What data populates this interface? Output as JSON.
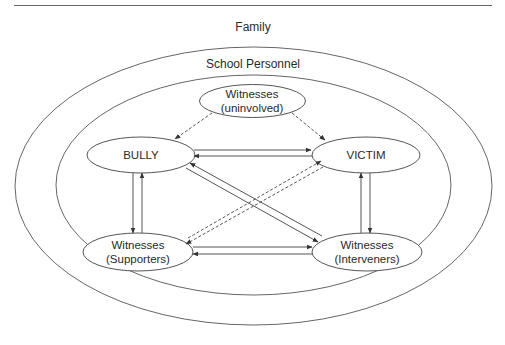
{
  "diagram": {
    "type": "nested-ellipse relationship diagram",
    "layers": {
      "outer": {
        "label": "Family"
      },
      "inner": {
        "label": "School Personnel"
      }
    },
    "nodes": {
      "uninvolved": {
        "line1": "Witnesses",
        "line2": "(uninvolved)"
      },
      "bully": {
        "label": "BULLY"
      },
      "victim": {
        "label": "VICTIM"
      },
      "supporters": {
        "line1": "Witnesses",
        "line2": "(Supporters)"
      },
      "interveners": {
        "line1": "Witnesses",
        "line2": "(Interveners)"
      }
    },
    "edges": [
      {
        "from": "Witnesses (uninvolved)",
        "to": "BULLY",
        "style": "dashed",
        "direction": "one-way"
      },
      {
        "from": "Witnesses (uninvolved)",
        "to": "VICTIM",
        "style": "dashed",
        "direction": "one-way"
      },
      {
        "from": "BULLY",
        "to": "VICTIM",
        "style": "solid",
        "direction": "two-way"
      },
      {
        "from": "BULLY",
        "to": "Witnesses (Supporters)",
        "style": "solid",
        "direction": "two-way"
      },
      {
        "from": "VICTIM",
        "to": "Witnesses (Interveners)",
        "style": "solid",
        "direction": "two-way"
      },
      {
        "from": "BULLY",
        "to": "Witnesses (Interveners)",
        "style": "solid",
        "direction": "two-way"
      },
      {
        "from": "Witnesses (Supporters)",
        "to": "VICTIM",
        "style": "dashed",
        "direction": "two-way"
      },
      {
        "from": "Witnesses (Supporters)",
        "to": "Witnesses (Interveners)",
        "style": "solid",
        "direction": "two-way"
      }
    ],
    "colors": {
      "line": "#555555",
      "text": "#2a2a2a",
      "background": "#ffffff"
    }
  }
}
